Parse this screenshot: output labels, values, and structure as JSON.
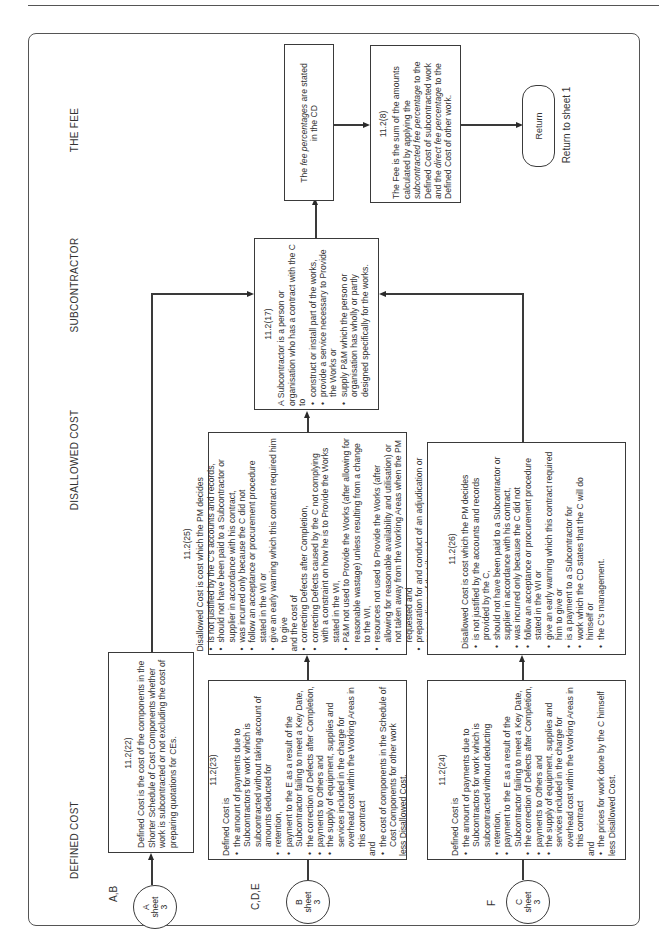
{
  "columns": {
    "defined_cost": "DEFINED COST",
    "disallowed_cost": "DISALLOWED COST",
    "subcontractor": "SUBCONTRACTOR",
    "the_fee": "THE FEE"
  },
  "connectors": [
    {
      "row_label": "A,B",
      "letter": "A",
      "sheet_word": "sheet",
      "sheet_no": "3"
    },
    {
      "row_label": "C,D,E",
      "letter": "B",
      "sheet_word": "sheet",
      "sheet_no": "3"
    },
    {
      "row_label": "F",
      "letter": "C",
      "sheet_word": "sheet",
      "sheet_no": "3"
    }
  ],
  "boxes": {
    "b_11_2_22": {
      "ref": "11.2(22)",
      "text": "Defined Cost is the cost of the components in the Shorter Schedule of Cost Components whether work is subcontracted or not excluding the cost of preparing quotations for CEs."
    },
    "b_11_2_23": {
      "ref": "11.2(23)",
      "intro": "Defined Cost is",
      "items": [
        "the amount of payments due to Subcontractors for work which is subcontracted without taking account of amounts deducted for",
        "retention,",
        "payment to the E as a result of the Subcontractor failing to meet a Key Date,",
        "the correction of Defects after Completion,",
        "payments to Others and",
        "the supply of equipment, supplies and services included in the charge for overhead cost within the Working Areas in this contract"
      ],
      "and": "and",
      "last_item": "the cost of components in the Schedule of Cost Components for other work",
      "less": "less Disallowed Cost."
    },
    "b_11_2_24": {
      "ref": "11.2(24)",
      "intro": "Defined Cost is",
      "items": [
        "the amount of payments due to Subcontractors for work which is subcontracted without deducting",
        "retention,",
        "payment to the E as a result of the Subcontractor failing to meet a Key Date,",
        "the correction of Defects after Completion,",
        "payments to Others and",
        "the supply of equipment, supplies and services included in the charge for overhead cost within the Working Areas in this contract"
      ],
      "and": "and",
      "last_item": "the prices for work done by the C himself",
      "less": "less Disallowed Cost."
    },
    "b_11_2_25": {
      "ref": "11.2(25)",
      "intro": "Disallowed Cost is cost which the PM decides",
      "items": [
        "is not justified by the C's accounts and records,",
        "should not have been paid to a Subcontractor or supplier in accordance with his contract,",
        "was incurred only because the C did not",
        "follow an acceptance or procurement procedure stated in the WI or",
        "give an early warning which this contract required him to give"
      ],
      "and": "and the cost of",
      "items2": [
        "correcting Defects after Completion,",
        "correcting Defects caused by the C not complying with a constraint on how he is to Provide the Works stated in the WI,",
        "P&M not used to Provide the Works (after allowing for reasonable wastage) unless resulting from a change to the WI,",
        "resources not used to Provide the Works (after allowing for reasonable availability and utilisation) or not taken away from the Working Areas when the PM requested and",
        "preparation for and conduct of an adjudication or proceedings of the tribunal."
      ]
    },
    "b_11_2_26": {
      "ref": "11.2(26)",
      "intro": "Disallowed Cost is cost which the PM decides",
      "items": [
        "is not justified by the accounts and records provided by the C,",
        "should not have been paid to a Subcontractor or supplier in accordance with his contract,",
        "was incurred only because the C did not",
        "follow an acceptance or procurement procedure stated in the WI or",
        "give an early warning which this contract required him to give or",
        "is a payment to a Subcontractor for",
        "work which the CD states that the C will do himself or",
        "the C's management."
      ]
    },
    "b_11_2_17": {
      "ref": "11.2(17)",
      "intro": "A Subcontractor is a person or organisation who has a contract with the C to",
      "items": [
        "construct or install part of the works,",
        "provide a service necessary to Provide the Works or",
        "supply P&M which the person or organisation has wholly or partly designed specifically for the works."
      ]
    },
    "fee_pct": {
      "text_pre": "The ",
      "text_em": "fee percentages",
      "text_post": " are stated in the CD"
    },
    "b_11_2_8": {
      "ref": "11.2(8)",
      "t1": "The Fee is the sum of the amounts calculated by applying the ",
      "em1": "subcontracted fee percentage",
      "t2": " to the Defined Cost of subcontracted work and the ",
      "em2": "direct fee percentage",
      "t3": " to the Defined Cost of other work."
    },
    "return": {
      "label": "Return",
      "caption": "Return to sheet 1"
    }
  }
}
